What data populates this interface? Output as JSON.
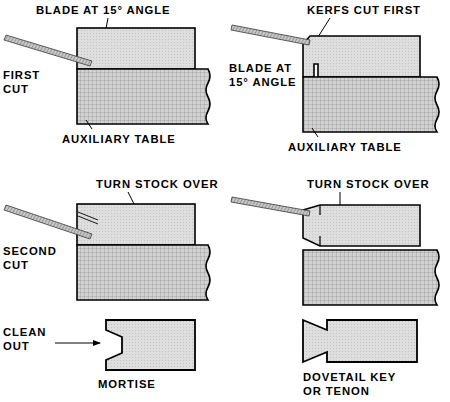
{
  "figure": {
    "panel_count": 6
  },
  "colors": {
    "stock_fill": "#dcdcdc",
    "table_fill": "#c9c9c9",
    "blade_fill": "#b0b0b0",
    "outline": "#000000",
    "background": "#ffffff"
  },
  "panels": [
    {
      "id": "first-cut-left",
      "step_label_line1": "FIRST",
      "step_label_line2": "CUT",
      "top_caption": "BLADE AT 15° ANGLE",
      "bottom_caption": "AUXILIARY TABLE"
    },
    {
      "id": "first-cut-right",
      "top_caption": "KERFS CUT FIRST",
      "side_caption_line1": "BLADE AT",
      "side_caption_line2": "15° ANGLE",
      "bottom_caption": "AUXILIARY TABLE"
    },
    {
      "id": "second-cut-left",
      "step_label_line1": "SECOND",
      "step_label_line2": "CUT",
      "top_caption": "TURN STOCK OVER"
    },
    {
      "id": "second-cut-right",
      "top_caption": "TURN STOCK OVER"
    },
    {
      "id": "mortise",
      "step_label_line1": "CLEAN",
      "step_label_line2": "OUT",
      "bottom_caption": "MORTISE"
    },
    {
      "id": "dovetail-key",
      "bottom_caption_line1": "DOVETAIL KEY",
      "bottom_caption_line2": "OR TENON"
    }
  ]
}
